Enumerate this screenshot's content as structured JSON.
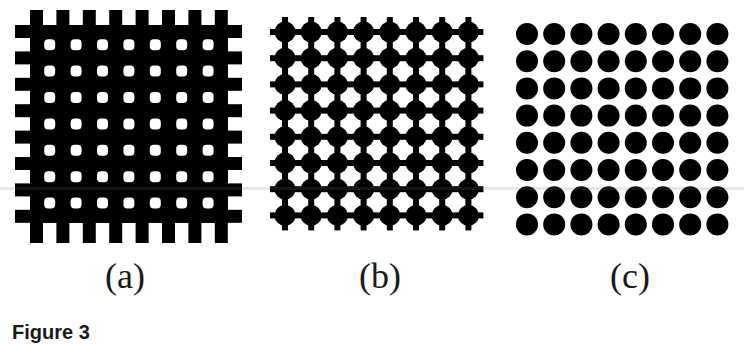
{
  "figure": {
    "panels": [
      {
        "id": "a",
        "label": "(a)",
        "description": "Black square lattice with rounded square holes and edge tabs",
        "grid_bars": 8,
        "holes_per_side": 7
      },
      {
        "id": "b",
        "label": "(b)",
        "description": "Black circles connected by thin bars with edge tabs",
        "dots_per_side": 8
      },
      {
        "id": "c",
        "label": "(c)",
        "description": "Isolated black circular dots",
        "dots_per_side": 8
      }
    ],
    "caption": "Figure 3",
    "colors": {
      "ink": "#000000",
      "background": "#ffffff"
    }
  }
}
